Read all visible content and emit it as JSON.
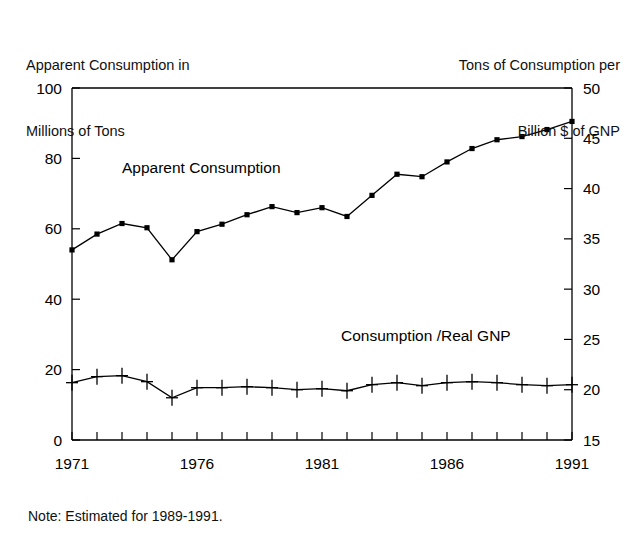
{
  "header": {
    "left_line1": "Apparent Consumption in",
    "left_line2": "Millions of Tons",
    "right_line1": "Tons of Consumption per",
    "right_line2": "Billion $ of GNP"
  },
  "note": "Note: Estimated for 1989-1991.",
  "labels": {
    "series1_label": "Apparent Consumption",
    "series2_label": "Consumption /Real GNP"
  },
  "chart_data": {
    "type": "line",
    "title": "",
    "xlabel": "",
    "ylabel": "Apparent Consumption in Millions of Tons",
    "y2label": "Tons of Consumption per Billion $ of GNP",
    "grid": false,
    "legend": "inline-annotation",
    "xlim": [
      1971,
      1991
    ],
    "ylim": [
      0,
      100
    ],
    "y2lim": [
      15,
      50
    ],
    "yticks": [
      0,
      20,
      40,
      60,
      80,
      100
    ],
    "y2ticks": [
      15,
      20,
      25,
      30,
      35,
      40,
      45,
      50
    ],
    "xticks": [
      1971,
      1972,
      1973,
      1974,
      1975,
      1976,
      1977,
      1978,
      1979,
      1980,
      1981,
      1982,
      1983,
      1984,
      1985,
      1986,
      1987,
      1988,
      1989,
      1990,
      1991
    ],
    "xtick_labels": [
      "1971",
      "",
      "",
      "",
      "",
      "1976",
      "",
      "",
      "",
      "",
      "1981",
      "",
      "",
      "",
      "",
      "1986",
      "",
      "",
      "",
      "",
      "1991"
    ],
    "x": [
      1971,
      1972,
      1973,
      1974,
      1975,
      1976,
      1977,
      1978,
      1979,
      1980,
      1981,
      1982,
      1983,
      1984,
      1985,
      1986,
      1987,
      1988,
      1989,
      1990,
      1991
    ],
    "series": [
      {
        "name": "Apparent Consumption",
        "axis": "left",
        "marker": "square",
        "units": "Millions of Tons",
        "values": [
          54.0,
          58.5,
          61.5,
          60.3,
          51.2,
          59.2,
          61.3,
          64.0,
          66.3,
          64.6,
          66.0,
          63.5,
          69.5,
          75.5,
          74.8,
          79.0,
          82.8,
          85.3,
          86.2,
          88.2,
          90.5
        ]
      },
      {
        "name": "Consumption /Real GNP",
        "axis": "right",
        "marker": "plus",
        "units": "Tons per Billion $ of GNP",
        "values": [
          20.7,
          21.3,
          21.4,
          20.8,
          19.2,
          20.2,
          20.2,
          20.3,
          20.2,
          20.0,
          20.1,
          19.9,
          20.5,
          20.7,
          20.4,
          20.7,
          20.8,
          20.7,
          20.5,
          20.4,
          20.5
        ]
      }
    ]
  },
  "colors": {
    "ink": "#000000",
    "background": "#ffffff"
  }
}
